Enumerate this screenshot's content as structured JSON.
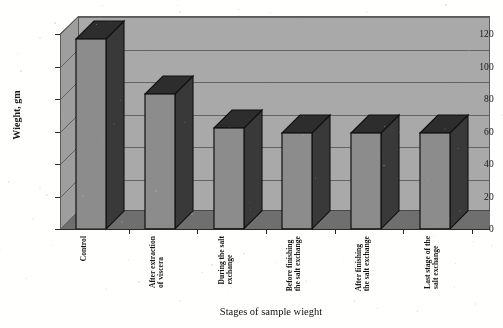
{
  "chart_data": {
    "type": "bar",
    "title": "",
    "xlabel": "Stages of sample wieght",
    "ylabel": "Wieght, gm",
    "categories": [
      "Control",
      "After extraction\nof viscera",
      "During the salt\nexchange",
      "Before finishing\nthe salt exchange",
      "After finishing\nthe salt exchange",
      "Last stage of the\nsalt exchange"
    ],
    "values": [
      117,
      83,
      62,
      59,
      59,
      59
    ],
    "ylim": [
      0,
      120
    ],
    "yticks": [
      0,
      20,
      40,
      60,
      80,
      100,
      120
    ],
    "ytick_labels": [
      "0",
      "20",
      "40",
      "60",
      "80",
      "100",
      "120"
    ],
    "grid": true,
    "legend": "none",
    "style": "3d-bar",
    "units": "gm"
  },
  "colors": {
    "wall": "#a8a8a8",
    "side_wall": "#9d9d9d",
    "floor": "#6f6f6f",
    "bar_front": "#8c8c8c",
    "bar_side": "#3a3a3a",
    "bar_top": "#2f2f2f",
    "gridline": "#4f4f4f",
    "axis": "#2a2a2a",
    "text": "#151515",
    "page": "#fdfdfb"
  }
}
